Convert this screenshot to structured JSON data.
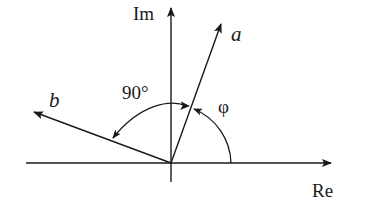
{
  "diagram": {
    "type": "complex-plane-phasor",
    "axes": {
      "real_label": "Re",
      "imag_label": "Im"
    },
    "vectors": [
      {
        "name": "a",
        "label": "a"
      },
      {
        "name": "b",
        "label": "b"
      }
    ],
    "angles": [
      {
        "name": "phi",
        "label": "φ",
        "from": "Re axis",
        "to": "a"
      },
      {
        "name": "right-angle",
        "label": "90°",
        "from": "a",
        "to": "b"
      }
    ],
    "colors": {
      "stroke": "#1a1a1a",
      "background": "#ffffff"
    }
  }
}
